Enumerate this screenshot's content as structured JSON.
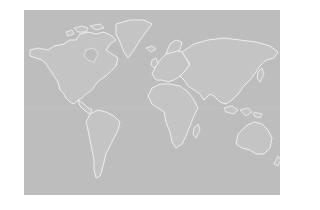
{
  "map": {
    "type": "world-map",
    "projection": "Mercator-like",
    "style": "white coastlines on gray",
    "colors": {
      "page_background": "#ffffff",
      "ocean": "#bdbdbd",
      "land": "#c4c4c4",
      "coastline": "#f4f4f4"
    },
    "regions": [
      "North America",
      "Greenland",
      "South America",
      "Europe",
      "Africa",
      "Asia",
      "Australia",
      "Indonesia",
      "New Zealand",
      "Madagascar",
      "Japan",
      "United Kingdom",
      "Iceland"
    ]
  }
}
